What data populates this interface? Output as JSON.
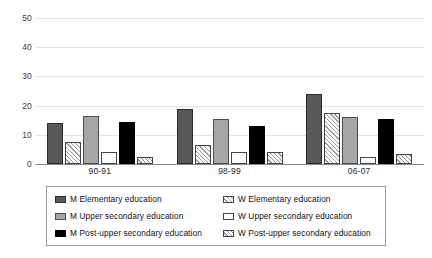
{
  "chart_data": {
    "type": "bar",
    "title": "",
    "subtitle": "",
    "xlabel": "",
    "ylabel": "",
    "ylim": [
      0,
      50
    ],
    "yticks": [
      0,
      10,
      20,
      30,
      40,
      50
    ],
    "grid": true,
    "legend_position": "bottom",
    "categories": [
      "90-91",
      "98-99",
      "06-07"
    ],
    "series": [
      {
        "name": "M Elementary education",
        "values": [
          14,
          19,
          24
        ],
        "swatch": "solid-dark-gray",
        "color": "#595959"
      },
      {
        "name": "W Elementary education",
        "values": [
          7.5,
          6.5,
          17.5
        ],
        "swatch": "white-hatch",
        "color": "#ffffff"
      },
      {
        "name": "M Upper secondary education",
        "values": [
          16.5,
          15.5,
          16
        ],
        "swatch": "solid-mid-gray",
        "color": "#a6a6a6"
      },
      {
        "name": "W Upper secondary education",
        "values": [
          4,
          4,
          2.5
        ],
        "swatch": "white-plain",
        "color": "#fbfbfb"
      },
      {
        "name": "M Post-upper secondary education",
        "values": [
          14.5,
          13,
          15.5
        ],
        "swatch": "solid-black",
        "color": "#000000"
      },
      {
        "name": "W Post-upper secondary education",
        "values": [
          2.5,
          4,
          3.5
        ],
        "swatch": "white-diagonal-hatch",
        "color": "#ffffff"
      }
    ]
  },
  "axis": {
    "y_tick_labels": [
      "50",
      "40",
      "30",
      "20",
      "10",
      "0"
    ],
    "x_tick_labels": [
      "90-91",
      "98-99",
      "06-07"
    ]
  },
  "legend": {
    "left_column": [
      "M Elementary education",
      "M Upper secondary education",
      "M Post-upper secondary education"
    ],
    "right_column": [
      "W Elementary education",
      "W Upper secondary education",
      "W Post-upper secondary education"
    ]
  },
  "colors": {
    "grid": "#e2e2e2",
    "axis": "#8a8a8a",
    "legend_border": "#9b9b9b",
    "text": "#101010"
  }
}
